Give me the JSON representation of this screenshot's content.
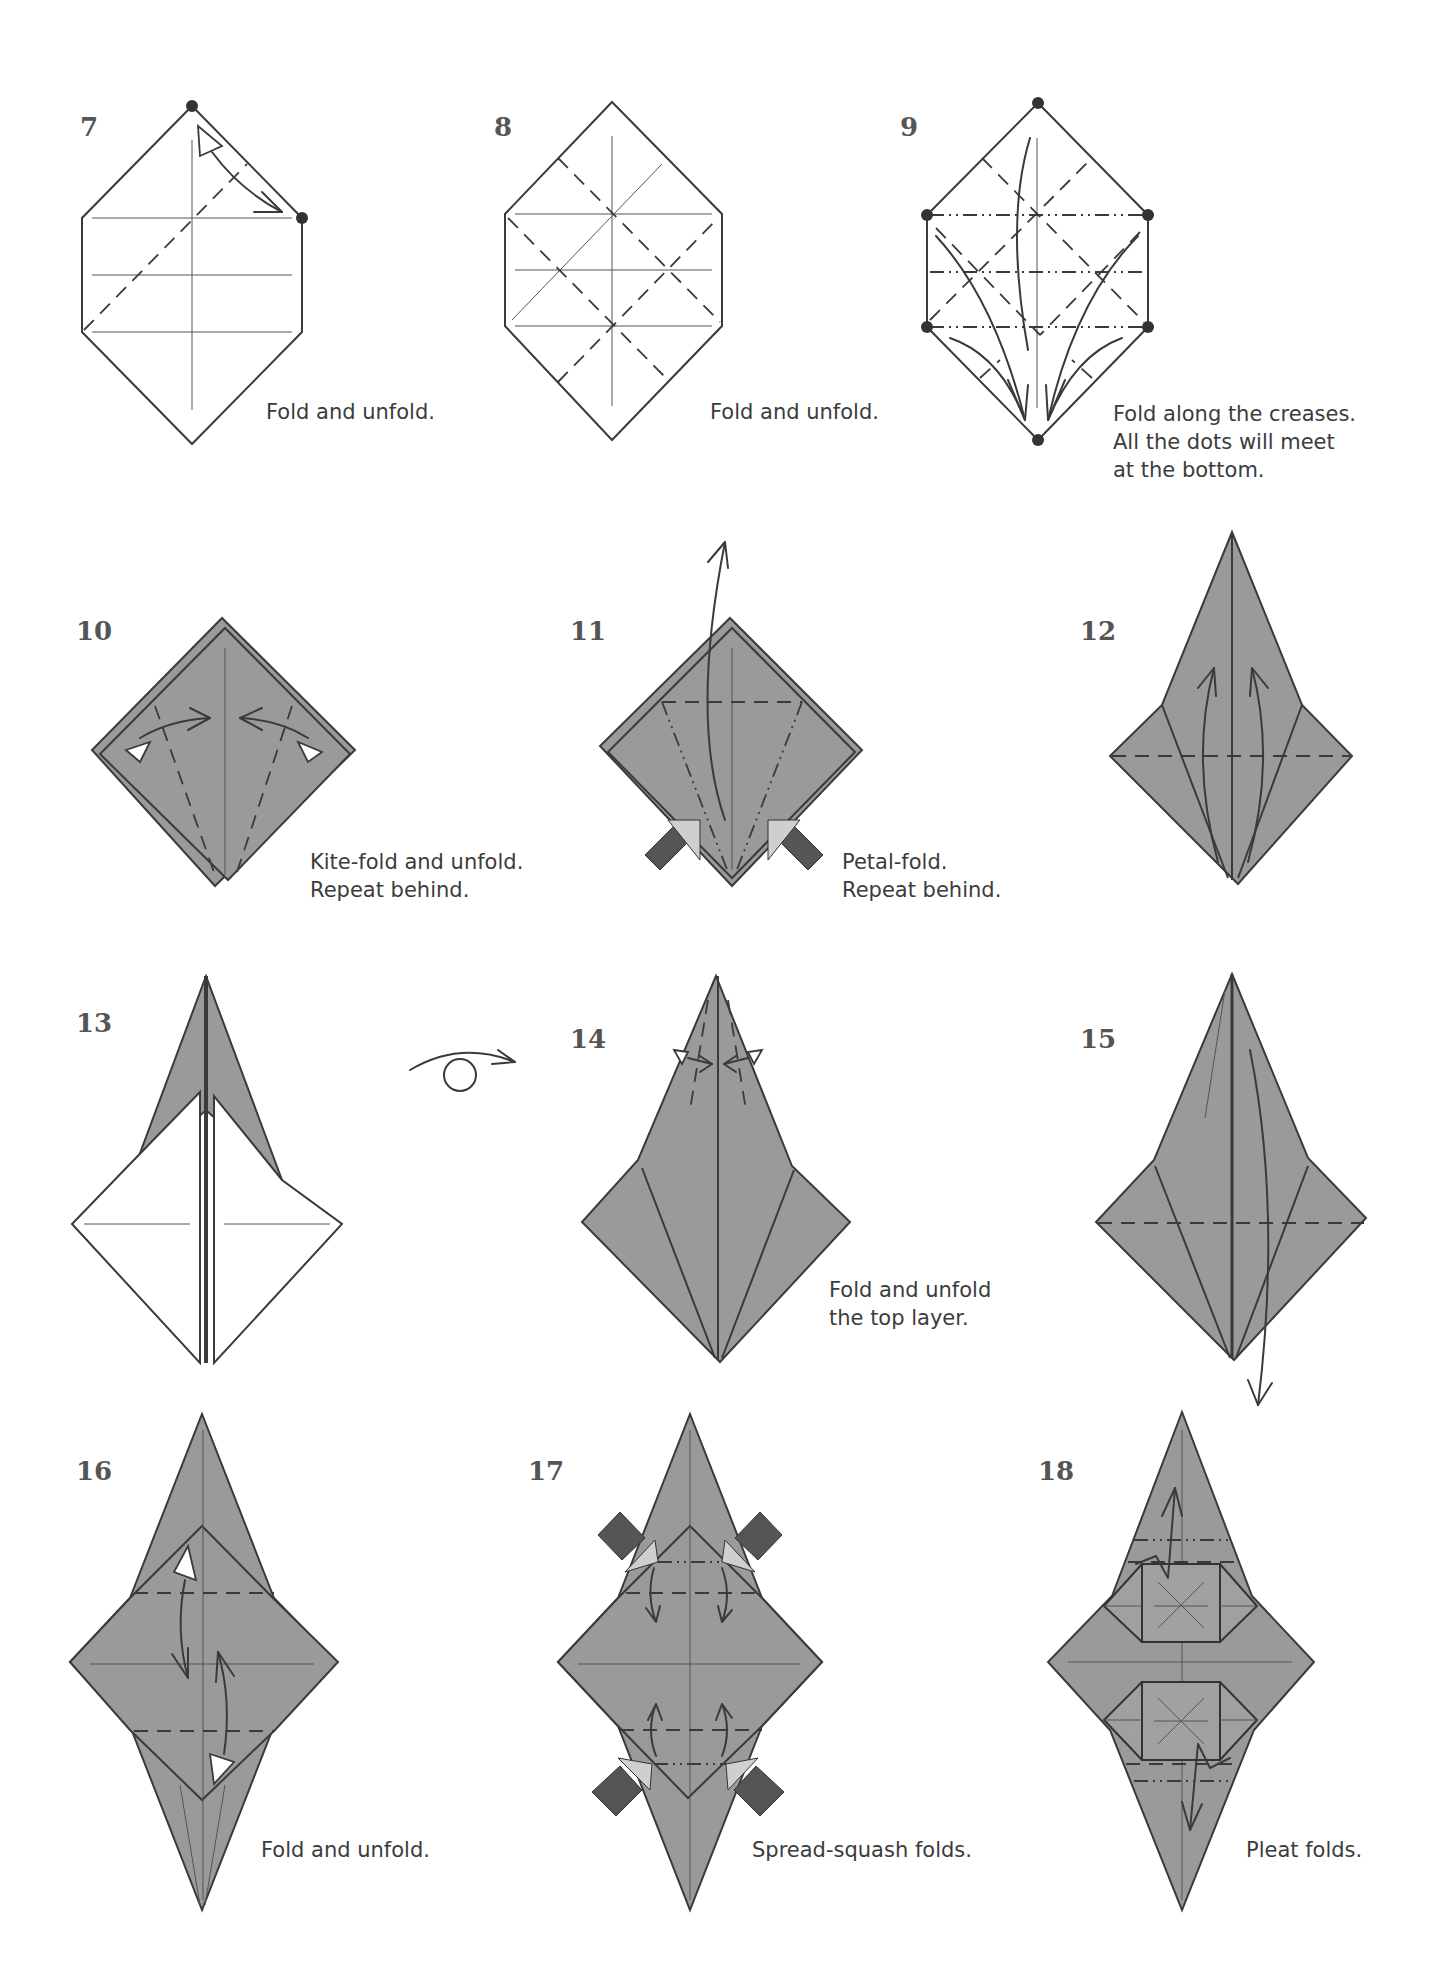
{
  "page": {
    "type": "origami instruction diagrams",
    "paper_colors": {
      "front": "#9a9a9a",
      "back": "#ffffff",
      "line": "#3a3a3a"
    },
    "line_legend": {
      "valley_fold": "dashed line",
      "mountain_fold": "dash-dot-dot line",
      "crease": "thin solid line"
    }
  },
  "steps": [
    {
      "number": "7",
      "caption": [
        "Fold and unfold."
      ],
      "paper": "white hexagon",
      "icons": [
        "fold-unfold-arrow",
        "reference-dot",
        "reference-dot"
      ]
    },
    {
      "number": "8",
      "caption": [
        "Fold and unfold."
      ],
      "paper": "white hexagon",
      "icons": []
    },
    {
      "number": "9",
      "caption": [
        "Fold along the creases.",
        "All the dots will meet",
        "at the bottom."
      ],
      "paper": "white hexagon",
      "icons": [
        "reference-dot x6",
        "fold-arrow x5"
      ]
    },
    {
      "number": "10",
      "caption": [
        "Kite-fold and unfold.",
        "Repeat behind."
      ],
      "paper": "gray square base",
      "icons": [
        "fold-unfold-arrow",
        "fold-unfold-arrow"
      ]
    },
    {
      "number": "11",
      "caption": [
        "Petal-fold.",
        "Repeat behind."
      ],
      "paper": "gray square base",
      "icons": [
        "lift-arrow",
        "push-arrow",
        "push-arrow"
      ]
    },
    {
      "number": "12",
      "caption": [],
      "paper": "gray bird base",
      "icons": [
        "fold-arrow",
        "fold-arrow"
      ]
    },
    {
      "number": "13",
      "caption": [],
      "paper": "bird base white side",
      "icons": [
        "turn-over-icon"
      ]
    },
    {
      "number": "14",
      "caption": [
        "Fold and unfold",
        "the top layer."
      ],
      "paper": "gray bird base",
      "icons": [
        "fold-unfold-arrow",
        "fold-unfold-arrow"
      ]
    },
    {
      "number": "15",
      "caption": [],
      "paper": "gray bird base",
      "icons": [
        "fold-arrow-down"
      ]
    },
    {
      "number": "16",
      "caption": [
        "Fold and unfold."
      ],
      "paper": "gray stretched diamond",
      "icons": [
        "fold-unfold-arrow",
        "fold-unfold-arrow"
      ]
    },
    {
      "number": "17",
      "caption": [
        "Spread-squash folds."
      ],
      "paper": "gray stretched diamond",
      "icons": [
        "push-arrow x4",
        "fold-arrow x4"
      ]
    },
    {
      "number": "18",
      "caption": [
        "Pleat folds."
      ],
      "paper": "gray stretched diamond",
      "icons": [
        "pleat-arrow",
        "pleat-arrow"
      ]
    }
  ]
}
